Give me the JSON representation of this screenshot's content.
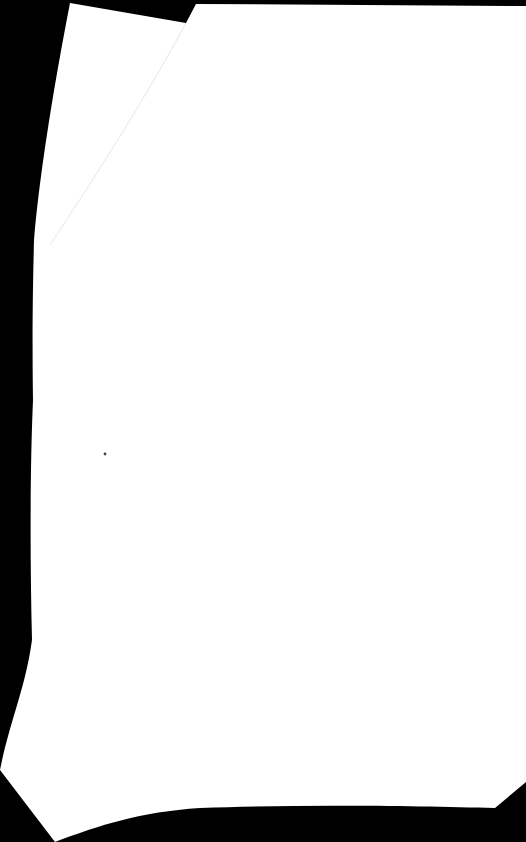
{
  "page": {
    "type": "blank scanned page",
    "background_color": "#000000",
    "paper_color": "#ffffff",
    "fold_line_color": "#e8e8e8",
    "speck_color": "#444444"
  }
}
